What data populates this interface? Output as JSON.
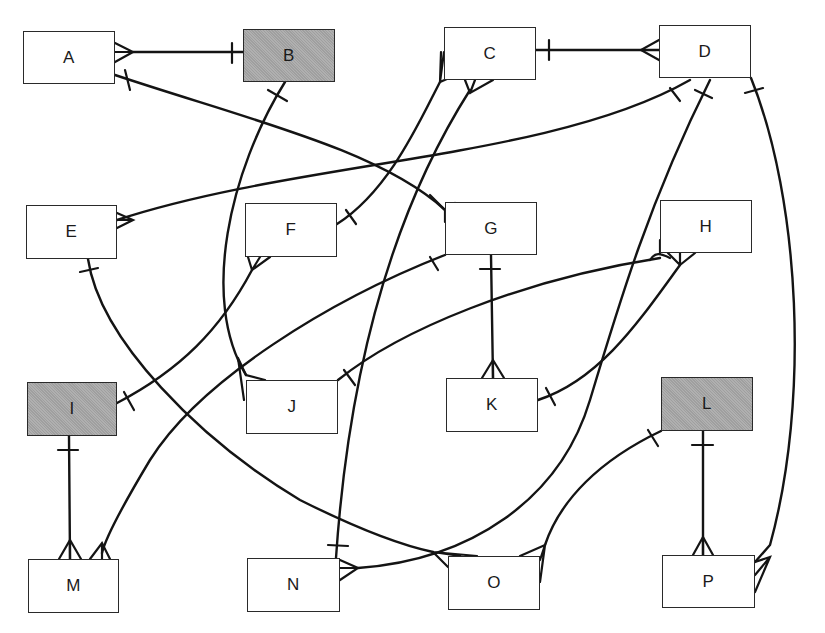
{
  "diagram": {
    "type": "entity-relationship",
    "notation": "crow's foot (bar = one, fork = many)",
    "colors": {
      "line": "#141414",
      "entity_fill": "#ffffff",
      "shaded_fill": "#a9a9a9",
      "border": "#2a2a2a"
    },
    "entities": [
      {
        "id": "A",
        "label": "A",
        "shaded": false,
        "box": [
          23,
          31,
          92,
          53
        ]
      },
      {
        "id": "B",
        "label": "B",
        "shaded": true,
        "box": [
          243,
          29,
          92,
          53
        ]
      },
      {
        "id": "C",
        "label": "C",
        "shaded": false,
        "box": [
          444,
          27,
          92,
          53
        ]
      },
      {
        "id": "D",
        "label": "D",
        "shaded": false,
        "box": [
          659,
          25,
          92,
          53
        ]
      },
      {
        "id": "E",
        "label": "E",
        "shaded": false,
        "box": [
          26,
          205,
          91,
          54
        ]
      },
      {
        "id": "F",
        "label": "F",
        "shaded": false,
        "box": [
          245,
          203,
          92,
          54
        ]
      },
      {
        "id": "G",
        "label": "G",
        "shaded": false,
        "box": [
          445,
          202,
          92,
          53
        ]
      },
      {
        "id": "H",
        "label": "H",
        "shaded": false,
        "box": [
          660,
          200,
          92,
          53
        ]
      },
      {
        "id": "I",
        "label": "I",
        "shaded": true,
        "box": [
          27,
          382,
          90,
          54
        ]
      },
      {
        "id": "J",
        "label": "J",
        "shaded": false,
        "box": [
          246,
          380,
          92,
          54
        ]
      },
      {
        "id": "K",
        "label": "K",
        "shaded": false,
        "box": [
          446,
          378,
          92,
          54
        ]
      },
      {
        "id": "L",
        "label": "L",
        "shaded": true,
        "box": [
          661,
          377,
          92,
          54
        ]
      },
      {
        "id": "M",
        "label": "M",
        "shaded": false,
        "box": [
          28,
          559,
          91,
          54
        ]
      },
      {
        "id": "N",
        "label": "N",
        "shaded": false,
        "box": [
          247,
          558,
          93,
          54
        ]
      },
      {
        "id": "O",
        "label": "O",
        "shaded": false,
        "box": [
          448,
          556,
          92,
          54
        ]
      },
      {
        "id": "P",
        "label": "P",
        "shaded": false,
        "box": [
          662,
          555,
          93,
          53
        ]
      }
    ],
    "relationships": [
      {
        "one": "B",
        "many": "A"
      },
      {
        "one": "A",
        "many": "G"
      },
      {
        "one": "C",
        "many": "D"
      },
      {
        "one": "B",
        "many": "J"
      },
      {
        "one": "F",
        "many": "C"
      },
      {
        "one": "N",
        "many": "C"
      },
      {
        "one": "D",
        "many": "E"
      },
      {
        "one": "D",
        "many": "N"
      },
      {
        "one": "D",
        "many": "P"
      },
      {
        "one": "I",
        "many": "F"
      },
      {
        "one": "G",
        "many": "K"
      },
      {
        "one": "G",
        "many": "M"
      },
      {
        "one": "J",
        "many": "H"
      },
      {
        "one": "K",
        "many": "H"
      },
      {
        "one": "E",
        "many": "O"
      },
      {
        "one": "I",
        "many": "M"
      },
      {
        "one": "L",
        "many": "O"
      },
      {
        "one": "L",
        "many": "P"
      }
    ]
  }
}
